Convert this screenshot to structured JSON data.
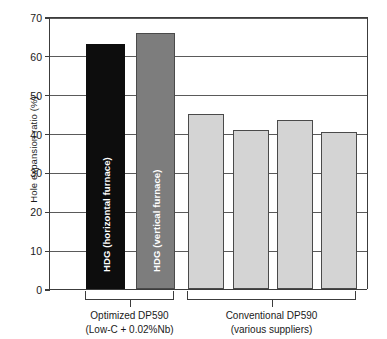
{
  "chart_data": {
    "type": "bar",
    "title": "",
    "xlabel": "",
    "ylabel": "Hole expansion ratio (%)",
    "ylim": [
      0,
      70
    ],
    "yticks": [
      0,
      10,
      20,
      30,
      40,
      50,
      60,
      70
    ],
    "ytick_labels": [
      "0",
      "10",
      "20",
      "30",
      "40",
      "50",
      "60",
      "70"
    ],
    "grid": true,
    "legend": "none",
    "categories": [
      "HDG (horizontal furnace)",
      "HDG (vertical furnace)",
      "Conventional supplier 1",
      "Conventional supplier 2",
      "Conventional supplier 3",
      "Conventional supplier 4"
    ],
    "values": [
      63,
      66,
      45,
      41,
      43.5,
      40.5
    ],
    "bar_colors": [
      "#0d0d0d",
      "#7d7d7d",
      "#d4d4d4",
      "#d4d4d4",
      "#d4d4d4",
      "#d4d4d4"
    ],
    "bars": [
      {
        "value": 63,
        "style": "dark",
        "label": "HDG (horizontal furnace)",
        "show_label": true
      },
      {
        "value": 66,
        "style": "mid",
        "label": "HDG (vertical furnace)",
        "show_label": true
      },
      {
        "value": 45,
        "style": "light",
        "label": "",
        "show_label": false
      },
      {
        "value": 41,
        "style": "light",
        "label": "",
        "show_label": false
      },
      {
        "value": 43.5,
        "style": "light",
        "label": "",
        "show_label": false
      },
      {
        "value": 40.5,
        "style": "light",
        "label": "",
        "show_label": false
      }
    ],
    "groups": [
      {
        "line1": "Optimized DP590",
        "line2": "(Low-C + 0.02%Nb)",
        "bars": [
          0,
          1
        ]
      },
      {
        "line1": "Conventional DP590",
        "line2": "(various suppliers)",
        "bars": [
          2,
          3,
          4,
          5
        ]
      }
    ]
  },
  "axis": {
    "y_title": "Hole expansion ratio (%)"
  },
  "colors": {
    "axis": "#3c3c3c",
    "gridline": "#5a5a5a",
    "bar_dark": "#0d0d0d",
    "bar_mid": "#7d7d7d",
    "bar_light": "#d4d4d4",
    "text": "#1a1a1a",
    "bar_label_text": "#ffffff",
    "background": "#ffffff"
  }
}
